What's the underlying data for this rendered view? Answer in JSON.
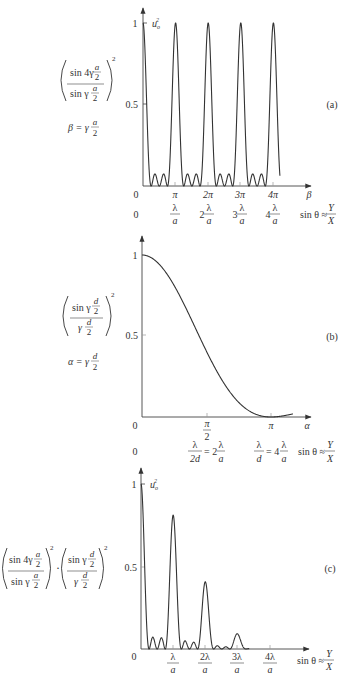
{
  "chart_data": [
    {
      "type": "line",
      "panel_label": "(a)",
      "title": "",
      "formula": {
        "numerator": "sin 4γ a/2",
        "denominator": "sin γ a/2",
        "exponent": "2",
        "definition": "β = γ a/2"
      },
      "ylabel": "u_o^2",
      "xlabel": "β",
      "xlabel2": "sin θ ≈ Y/X",
      "yticks": [
        "0",
        "0.5",
        "1"
      ],
      "ylim": [
        0,
        1
      ],
      "xticks": [
        "0",
        "π",
        "2π",
        "3π",
        "4π"
      ],
      "xticks2": [
        "0",
        "λ/a",
        "2 λ/a",
        "3 λ/a",
        "4 λ/a"
      ],
      "description": "Normalized 4-slit interference pattern: principal maxima of height 1 at β = 0, π, 2π, 3π, 4π with two small subsidiary maxima (~0.05) between each pair",
      "x": [
        0,
        1,
        2,
        3,
        4
      ],
      "principal_maxima": [
        1,
        1,
        1,
        1,
        1
      ],
      "subsidiary_max": 0.05
    },
    {
      "type": "line",
      "panel_label": "(b)",
      "formula": {
        "numerator": "sin γ d/2",
        "denominator": "γ d/2",
        "exponent": "2",
        "definition": "α = γ d/2"
      },
      "ylabel": "",
      "xlabel": "α",
      "xlabel2": "sin θ ≈ Y/X",
      "yticks": [
        "0",
        "0.5",
        "1"
      ],
      "ylim": [
        0,
        1
      ],
      "xticks": [
        "0",
        "π/2",
        "π"
      ],
      "xticks2": [
        "0",
        "λ/2d = 2 λ/a",
        "λ/d = 4 λ/a"
      ],
      "description": "Single-slit diffraction envelope: sinc² falling from 1 at α=0 to 0 at α=π",
      "x": [
        0,
        0.25,
        0.5,
        0.75,
        1.0
      ],
      "values": [
        1.0,
        0.81,
        0.41,
        0.1,
        0.0
      ]
    },
    {
      "type": "line",
      "panel_label": "(c)",
      "formula": {
        "part1_numerator": "sin 4γ a/2",
        "part1_denominator": "sin γ a/2",
        "part2_numerator": "sin γ d/2",
        "part2_denominator": "γ d/2",
        "exponent": "2",
        "operator": "·"
      },
      "ylabel": "u_o^2",
      "xlabel": "sin θ ≈ Y/X",
      "yticks": [
        "0",
        "0.5",
        "1"
      ],
      "ylim": [
        0,
        1
      ],
      "xticks": [
        "0",
        "λ/a",
        "2λ/a",
        "3λ/a",
        "4λ/a"
      ],
      "description": "Product of interference and diffraction: principal maxima modulated by envelope",
      "x": [
        0,
        1,
        2,
        3,
        4
      ],
      "principal_maxima": [
        1.0,
        0.81,
        0.41,
        0.09,
        0.0
      ],
      "subsidiary_max": [
        0.07,
        0.04,
        0.015
      ]
    }
  ],
  "labels": {
    "a": {
      "panel": "(a)",
      "y1": "1",
      "y05": "0.5",
      "y0": "0",
      "ylabel": "u",
      "ylabel_sub": "o",
      "ylabel_sup": "2",
      "xt": [
        "π",
        "2π",
        "3π",
        "4π"
      ],
      "xaxis": "β",
      "row2_zero": "0",
      "row2_coef": [
        "",
        "2",
        "3",
        "4"
      ],
      "lambda": "λ",
      "a": "a",
      "sin_label": "sin θ ≈",
      "Y": "Y",
      "X": "X",
      "f_num1": "sin 4γ",
      "f_den1": "sin γ",
      "f_frac_num": "a",
      "f_frac_den": "2",
      "f_exp": "2",
      "def_lhs": "β = γ",
      "def_num": "a",
      "def_den": "2"
    },
    "b": {
      "panel": "(b)",
      "y1": "1",
      "y05": "0.5",
      "y0": "0",
      "xt_pi": "π",
      "xt_half_num": "π",
      "xt_half_den": "2",
      "xaxis": "α",
      "row2_zero": "0",
      "r2a_num": "λ",
      "r2a_den": "2d",
      "r2a_eq": "= 2",
      "r2b_num": "λ",
      "r2b_den": "d",
      "r2b_eq": "= 4",
      "lambda": "λ",
      "a": "a",
      "sin_label": "sin θ ≈",
      "Y": "Y",
      "X": "X",
      "f_num1": "sin γ",
      "f_den1": "γ",
      "f_frac_num": "d",
      "f_frac_den": "2",
      "f_exp": "2",
      "def_lhs": "α = γ",
      "def_num": "d",
      "def_den": "2"
    },
    "c": {
      "panel": "(c)",
      "y1": "1",
      "y05": "0.5",
      "y0": "0",
      "ylabel": "u",
      "ylabel_sub": "o",
      "ylabel_sup": "2",
      "xt": [
        "λ",
        "2λ",
        "3λ",
        "4λ"
      ],
      "a": "a",
      "sin_label": "sin θ ≈",
      "Y": "Y",
      "X": "X",
      "dot": "·"
    }
  }
}
